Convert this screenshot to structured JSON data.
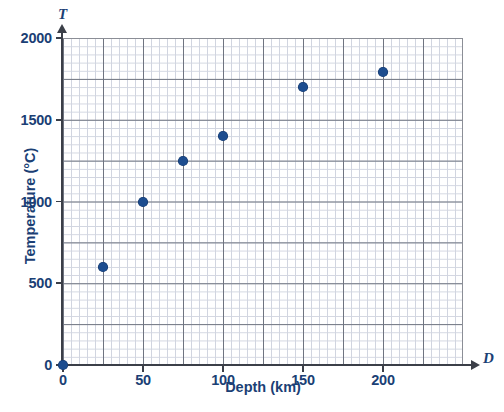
{
  "chart_data": {
    "type": "scatter",
    "title": "",
    "xlabel": "Depth (km)",
    "ylabel": "Temperature (°C)",
    "x_axis_symbol": "D",
    "y_axis_symbol": "T",
    "xlim": [
      0,
      250
    ],
    "ylim": [
      0,
      2000
    ],
    "x_ticks": [
      0,
      50,
      100,
      150,
      200
    ],
    "y_ticks": [
      0,
      500,
      1000,
      1500,
      2000
    ],
    "x_tick_labels": [
      "0",
      "50",
      "100",
      "150",
      "200"
    ],
    "y_tick_labels": [
      "0",
      "500",
      "1000",
      "1500",
      "2000"
    ],
    "grid": true,
    "grid_major_x_step": 25,
    "grid_major_y_step": 250,
    "grid_minor_x_step": 5,
    "grid_minor_y_step": 50,
    "legend": "none",
    "series": [
      {
        "name": "Temperature vs Depth",
        "marker": "circle",
        "color": "#1d4d8f",
        "points": [
          {
            "x": 0,
            "y": 0
          },
          {
            "x": 25,
            "y": 600
          },
          {
            "x": 50,
            "y": 1000
          },
          {
            "x": 75,
            "y": 1250
          },
          {
            "x": 100,
            "y": 1400
          },
          {
            "x": 150,
            "y": 1700
          },
          {
            "x": 200,
            "y": 1790
          }
        ]
      }
    ]
  },
  "colors": {
    "axis": "#3b3f48",
    "label": "#1b3f75",
    "marker": "#1d4d8f",
    "grid_major": "#6f7480",
    "grid_minor": "#c9cedb",
    "background": "#ffffff"
  }
}
